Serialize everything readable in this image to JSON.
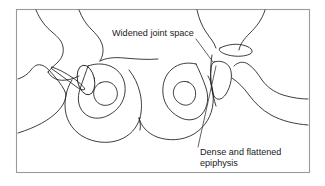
{
  "figure": {
    "name": "pelvis-ap-radiograph-tracing",
    "background_color": "#ffffff",
    "frame": {
      "border_color": "#9a9a9a",
      "fill_color": "#ffffff",
      "x": 16,
      "y": 9,
      "width": 294,
      "height": 164
    },
    "line_art": {
      "stroke_color": "#1b1b1b",
      "stroke_width": 0.85
    },
    "leader_line_color": "#3a3a3a",
    "text_color": "#1a1a1a"
  },
  "annotations": [
    {
      "id": "widened-joint-space",
      "label": "Widened joint space",
      "text_x": 112,
      "text_y": 36,
      "anchor": "start",
      "leader_from_x": 196,
      "leader_from_y": 39,
      "leader_to_x": 213,
      "leader_to_y": 62
    },
    {
      "id": "dense-flattened-epiphysis",
      "label_line_1": "Dense and flattened",
      "label_line_2": "epiphysis",
      "text_x": 200,
      "text_y": 155,
      "anchor": "start",
      "leader_from_x": 198,
      "leader_from_y": 147,
      "leader_to_x": 216,
      "leader_to_y": 66
    }
  ],
  "structures": {
    "left_iliac_crest": "left-iliac-crest-outline",
    "right_iliac_crest": "right-iliac-crest-outline",
    "left_obturator_foramen": "left-obturator-foramen",
    "right_obturator_foramen": "right-obturator-foramen",
    "left_femoral_head": "left-femoral-head-oval",
    "right_femoral_head": "right-femoral-head-flattened",
    "left_femoral_neck": "left-femoral-neck-slot",
    "left_greater_trochanter": "left-greater-trochanter",
    "right_greater_trochanter": "right-greater-trochanter",
    "left_femoral_shaft": "left-femoral-shaft",
    "right_femoral_shaft": "right-femoral-shaft",
    "sacrum_midline": "sacrum-midline"
  }
}
